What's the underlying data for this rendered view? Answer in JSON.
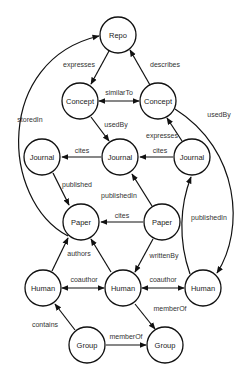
{
  "diagram": {
    "type": "knowledge-graph",
    "nodes": {
      "repo": {
        "label": "Repo",
        "x": 118,
        "y": 35
      },
      "concept_l": {
        "label": "Concept",
        "x": 80,
        "y": 101
      },
      "concept_r": {
        "label": "Concept",
        "x": 158,
        "y": 101
      },
      "journal_l": {
        "label": "Journal",
        "x": 42,
        "y": 157
      },
      "journal_m": {
        "label": "Journal",
        "x": 120,
        "y": 157
      },
      "journal_r": {
        "label": "Journal",
        "x": 192,
        "y": 157
      },
      "paper_l": {
        "label": "Paper",
        "x": 81,
        "y": 222
      },
      "paper_r": {
        "label": "Paper",
        "x": 162,
        "y": 222
      },
      "human_l": {
        "label": "Human",
        "x": 43,
        "y": 288
      },
      "human_m": {
        "label": "Human",
        "x": 123,
        "y": 288
      },
      "human_r": {
        "label": "Human",
        "x": 203,
        "y": 288
      },
      "group_l": {
        "label": "Group",
        "x": 87,
        "y": 345
      },
      "group_r": {
        "label": "Group",
        "x": 165,
        "y": 345
      }
    },
    "edges": {
      "e1": {
        "label": "expresses",
        "from": "Repo",
        "to": "Concept (left)"
      },
      "e2": {
        "label": "describes",
        "from": "Concept (right)",
        "to": "Repo"
      },
      "e3": {
        "label": "similarTo",
        "from": "Concept (left)",
        "to": "Concept (right)",
        "bidirectional": true
      },
      "e4": {
        "label": "storedIn",
        "from": "Paper (left)",
        "to": "Repo"
      },
      "e5": {
        "label": "usedBy",
        "from": "Concept (left)",
        "to": "Journal (middle)"
      },
      "e6": {
        "label": "usedBy",
        "from": "Concept (right)",
        "to": "Human (right)"
      },
      "e7": {
        "label": "expresses",
        "from": "Journal (right)",
        "to": "Concept (right)"
      },
      "e8": {
        "label": "cites",
        "from": "Journal (middle)",
        "to": "Journal (left)"
      },
      "e9": {
        "label": "cites",
        "from": "Journal (right)",
        "to": "Journal (middle)"
      },
      "e10": {
        "label": "published",
        "from": "Journal (left)",
        "to": "Paper (left)"
      },
      "e11": {
        "label": "publishedIn",
        "from": "Paper (right)",
        "to": "Journal (middle)"
      },
      "e12": {
        "label": "publishedIn",
        "from": "Human (right)",
        "to": "Journal (right)"
      },
      "e13": {
        "label": "cites",
        "from": "Paper (right)",
        "to": "Paper (left)"
      },
      "e14": {
        "label": "authors",
        "from": "Human (left)",
        "to": "Paper (left)"
      },
      "e15": {
        "label": "",
        "from": "Human (middle)",
        "to": "Paper (left)"
      },
      "e16": {
        "label": "writtenBy",
        "from": "Paper (right)",
        "to": "Human (middle)"
      },
      "e17": {
        "label": "coauthor",
        "from": "Human (left)",
        "to": "Human (middle)",
        "bidirectional": true
      },
      "e18": {
        "label": "coauthor",
        "from": "Human (middle)",
        "to": "Human (right)",
        "bidirectional": true
      },
      "e19": {
        "label": "memberOf",
        "from": "Human (middle)",
        "to": "Group (right)"
      },
      "e20": {
        "label": "contains",
        "from": "Group (left)",
        "to": "Human (left)"
      },
      "e21": {
        "label": "memberOf",
        "from": "Group (left)",
        "to": "Group (right)"
      }
    },
    "colors": {
      "stroke": "#111111",
      "fill": "#ffffff",
      "text": "#222222"
    }
  }
}
